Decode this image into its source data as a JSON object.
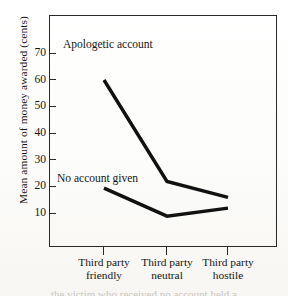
{
  "chart_data": {
    "type": "line",
    "title": "",
    "xlabel": "",
    "ylabel": "Mean amount of money awarded (cents)",
    "categories": [
      "Third party friendly",
      "Third party neutral",
      "Third party hostile"
    ],
    "category_lines": [
      [
        "Third party",
        "friendly"
      ],
      [
        "Third party",
        "neutral"
      ],
      [
        "Third party",
        "hostile"
      ]
    ],
    "series": [
      {
        "name": "Apologetic account",
        "values": [
          60,
          22,
          16
        ]
      },
      {
        "name": "No account given",
        "values": [
          19.5,
          9,
          12
        ]
      }
    ],
    "yticks": [
      70,
      60,
      50,
      40,
      30,
      20,
      10
    ],
    "ylim": [
      0,
      75
    ],
    "grid": false,
    "legend": "inline annotations",
    "line_color": "#111111",
    "frame_color": "#2a2a2a"
  },
  "annotations": {
    "apologetic": "Apologetic account",
    "no_account": "No account given"
  },
  "artifact": {
    "cropped_text": "the victim who received no account held a"
  }
}
